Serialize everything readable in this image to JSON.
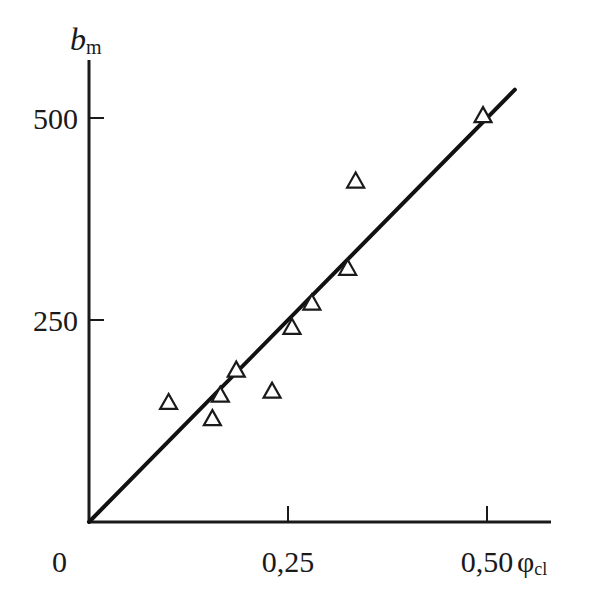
{
  "chart_data": {
    "type": "scatter",
    "title": "",
    "xlabel": "φcl",
    "xlabel_main": "φ",
    "xlabel_sub": "cl",
    "ylabel": "bm",
    "ylabel_main": "b",
    "ylabel_sub": "m",
    "xlim": [
      0,
      0.57
    ],
    "ylim": [
      0,
      570
    ],
    "x_ticks": [
      0.25,
      0.5
    ],
    "x_tick_labels": [
      "0",
      "0,25",
      "0,50"
    ],
    "y_ticks": [
      250,
      500
    ],
    "y_tick_labels": [
      "250",
      "500"
    ],
    "grid": false,
    "legend": null,
    "marker": "open-triangle",
    "series": [
      {
        "name": "data",
        "points": [
          {
            "x": 0.1,
            "y": 147
          },
          {
            "x": 0.155,
            "y": 127
          },
          {
            "x": 0.165,
            "y": 156
          },
          {
            "x": 0.185,
            "y": 187
          },
          {
            "x": 0.23,
            "y": 161
          },
          {
            "x": 0.255,
            "y": 240
          },
          {
            "x": 0.28,
            "y": 270
          },
          {
            "x": 0.325,
            "y": 313
          },
          {
            "x": 0.335,
            "y": 421
          },
          {
            "x": 0.495,
            "y": 502
          }
        ]
      }
    ],
    "fit_line": {
      "x": [
        0,
        0.535
      ],
      "y": [
        0,
        535
      ]
    }
  }
}
